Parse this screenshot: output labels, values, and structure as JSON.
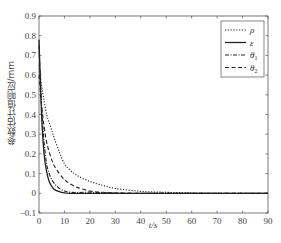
{
  "chart_data": {
    "type": "line",
    "title": "",
    "xlabel": "t/s",
    "ylabel": "参数估计值响应/mm",
    "xlim": [
      0,
      90
    ],
    "ylim": [
      -0.1,
      0.9
    ],
    "xticks": [
      0,
      10,
      20,
      30,
      40,
      50,
      60,
      70,
      80,
      90
    ],
    "yticks": [
      -0.1,
      0,
      0.1,
      0.2,
      0.3,
      0.4,
      0.5,
      0.6,
      0.7,
      0.8,
      0.9
    ],
    "ytick_labels": [
      "-0.1",
      "0",
      "0.1",
      "0.2",
      "0.3",
      "0.4",
      "0.5",
      "0.6",
      "0.7",
      "0.8",
      "0.9"
    ],
    "grid": false,
    "legend_position": "upper right",
    "x": [
      0,
      1,
      2,
      3,
      4,
      5,
      6,
      8,
      10,
      12,
      15,
      20,
      25,
      30,
      40,
      50,
      60,
      70,
      80,
      90
    ],
    "series": [
      {
        "name": "ρ",
        "style": "dotted",
        "values": [
          0.65,
          0.55,
          0.47,
          0.4,
          0.36,
          0.32,
          0.28,
          0.21,
          0.15,
          0.12,
          0.09,
          0.06,
          0.04,
          0.025,
          0.01,
          0.005,
          0.002,
          0.0,
          0.0,
          0.0
        ]
      },
      {
        "name": "ε",
        "style": "solid",
        "values": [
          0.78,
          0.4,
          0.2,
          0.11,
          0.06,
          0.035,
          0.02,
          0.008,
          0.002,
          0.0,
          0.0,
          0.0,
          0.0,
          0.0,
          0.0,
          0.0,
          0.0,
          0.0,
          0.0,
          0.0
        ]
      },
      {
        "name": "θ1",
        "style": "dashdot",
        "values": [
          0.75,
          0.45,
          0.26,
          0.15,
          0.1,
          0.07,
          0.05,
          0.025,
          0.012,
          0.006,
          0.004,
          0.006,
          0.003,
          0.001,
          0.0,
          0.0,
          0.0,
          0.0,
          0.0,
          0.0
        ]
      },
      {
        "name": "θ2",
        "style": "dashed",
        "values": [
          0.6,
          0.45,
          0.34,
          0.26,
          0.21,
          0.17,
          0.14,
          0.1,
          0.07,
          0.05,
          0.03,
          0.012,
          0.005,
          0.002,
          0.0,
          0.0,
          0.0,
          0.0,
          0.0,
          0.0
        ]
      }
    ]
  },
  "legend": {
    "items": [
      {
        "label": "ρ",
        "sub": ""
      },
      {
        "label": "ε",
        "sub": ""
      },
      {
        "label": "θ",
        "sub": "1"
      },
      {
        "label": "θ",
        "sub": "2"
      }
    ]
  },
  "caption": ""
}
